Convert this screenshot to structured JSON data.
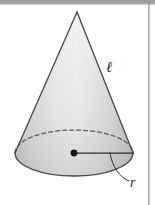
{
  "figure": {
    "name": "right-circular-cone-diagram",
    "background_color": "#ffffff",
    "width": 155,
    "height": 205
  },
  "scan_artifacts": {
    "top_band": {
      "name": "top-scan-band",
      "color": "#8d8d8d",
      "x": 0,
      "y": 0,
      "width": 155,
      "height": 4
    },
    "right_rule": {
      "name": "right-page-rule",
      "color": "#9a9a9a",
      "x": 148,
      "y": 0,
      "width": 1.6,
      "height": 205
    }
  },
  "cone": {
    "apex": {
      "x": 77,
      "y": 12
    },
    "base_center": {
      "x": 74,
      "y": 153
    },
    "base_rx": 59,
    "base_ry": 23,
    "body_fill_light": "#e9e9e9",
    "body_fill_mid": "#d7d7d7",
    "body_fill_dark": "#c2c2c2",
    "base_fill_light": "#c9c9c9",
    "base_fill_dark": "#a9a9a9",
    "outline_color": "#4a4a4a",
    "outline_width": 1.3,
    "hidden_edge_color": "#5a5a5a",
    "hidden_edge_dash": "4 3"
  },
  "annotations": {
    "slant_height": {
      "name": "slant-height-label",
      "symbol": "ℓ",
      "meaning": "slant height",
      "x": 112,
      "y": 68
    },
    "radius": {
      "name": "radius-label",
      "symbol": "r",
      "meaning": "base radius",
      "x": 134,
      "y": 183
    },
    "center_dot": {
      "name": "base-center-dot",
      "color": "#141414",
      "radius": 3.4,
      "x": 74,
      "y": 153
    },
    "radius_line": {
      "name": "radius-segment",
      "color": "#2b2b2b",
      "width": 1.2,
      "from": {
        "x": 74,
        "y": 153
      },
      "to": {
        "x": 133,
        "y": 153
      }
    },
    "leader_line": {
      "name": "radius-leader-line",
      "color": "#2b2b2b",
      "width": 1.0,
      "path": "M 110 153 C 112 166, 120 176, 129 180"
    }
  }
}
